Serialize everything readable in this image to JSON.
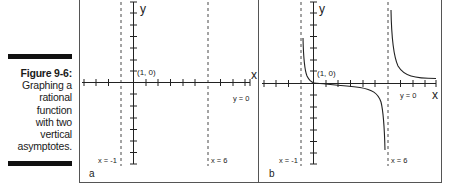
{
  "caption": {
    "figure_number": "Figure 9-6:",
    "lines": [
      "Graphing a",
      "rational",
      "function",
      "with two",
      "vertical",
      "asymptotes."
    ]
  },
  "panels": [
    {
      "id": "a",
      "label": "a",
      "axis_x_label": "x",
      "axis_y_label": "y",
      "point_label": "(1, 0)",
      "horizontal_asymptote_label": "y = 0",
      "vertical_asymptotes": [
        {
          "label": "x = -1",
          "value": -1
        },
        {
          "label": "x = 6",
          "value": 6
        }
      ],
      "shows_curve": false
    },
    {
      "id": "b",
      "label": "b",
      "axis_x_label": "x",
      "axis_y_label": "y",
      "point_label": "(1, 0)",
      "horizontal_asymptote_label": "y = 0",
      "vertical_asymptotes": [
        {
          "label": "x = -1",
          "value": -1
        },
        {
          "label": "x = 6",
          "value": 6
        }
      ],
      "shows_curve": true
    }
  ],
  "colors": {
    "ink": "#222222",
    "frame": "#555555",
    "caption_bar": "#111111"
  }
}
